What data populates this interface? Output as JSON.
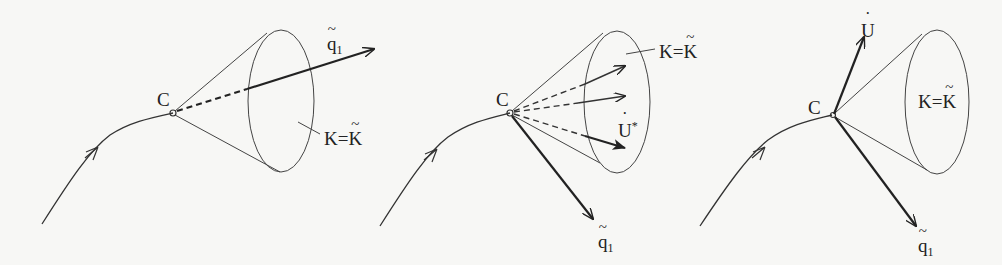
{
  "figure": {
    "panels": [
      {
        "id": "panel-1",
        "point_label": "C",
        "vector_label": {
          "base": "q",
          "accent": "tilde",
          "subscript": "1"
        },
        "cone_label": {
          "lhs": "K",
          "eq": "=",
          "rhs": "K",
          "rhs_accent": "tilde"
        }
      },
      {
        "id": "panel-2",
        "point_label": "C",
        "vector_label": {
          "base": "q",
          "accent": "tilde",
          "subscript": "1"
        },
        "cone_label": {
          "lhs": "K",
          "eq": "=",
          "rhs": "K",
          "rhs_accent": "tilde"
        },
        "inner_label": {
          "base": "U",
          "accent": "dot",
          "superscript": "*"
        }
      },
      {
        "id": "panel-3",
        "point_label": "C",
        "vector_label": {
          "base": "q",
          "accent": "tilde",
          "subscript": "1"
        },
        "up_vector_label": {
          "base": "U",
          "accent": "dot"
        },
        "cone_label": {
          "lhs": "K",
          "eq": "=",
          "rhs": "K",
          "rhs_accent": "tilde"
        }
      }
    ],
    "colors": {
      "background": "#f7f7f5",
      "ink": "#222222",
      "thin_line": "#444444"
    }
  }
}
